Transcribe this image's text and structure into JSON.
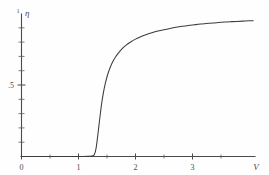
{
  "chart_data": {
    "type": "line",
    "title": "",
    "subtitle": "",
    "xlabel": "V",
    "ylabel": "η",
    "xlim": [
      0,
      3.85
    ],
    "ylim": [
      0,
      1.02
    ],
    "grid": false,
    "legend": null,
    "x_ticks": [
      {
        "value": 0,
        "label": "0",
        "major": true
      },
      {
        "value": 0.5,
        "label": "",
        "major": false
      },
      {
        "value": 1,
        "label": "1",
        "major": true
      },
      {
        "value": 1.5,
        "label": "",
        "major": false
      },
      {
        "value": 2,
        "label": "2",
        "major": true
      },
      {
        "value": 2.5,
        "label": "",
        "major": false
      },
      {
        "value": 3,
        "label": "3",
        "major": true
      },
      {
        "value": 3.5,
        "label": "",
        "major": false
      }
    ],
    "y_ticks": [
      {
        "value": 0.1,
        "label": "",
        "major": false
      },
      {
        "value": 0.2,
        "label": "",
        "major": false
      },
      {
        "value": 0.3,
        "label": "",
        "major": false
      },
      {
        "value": 0.4,
        "label": "",
        "major": false
      },
      {
        "value": 0.5,
        "label": ".5",
        "major": true
      },
      {
        "value": 0.6,
        "label": "",
        "major": false
      },
      {
        "value": 0.7,
        "label": "",
        "major": false
      },
      {
        "value": 0.8,
        "label": "",
        "major": false
      },
      {
        "value": 0.9,
        "label": "",
        "major": false
      },
      {
        "value": 1.0,
        "label": "1",
        "major": true
      }
    ],
    "series": [
      {
        "name": "η(V)",
        "color": "#3c3c3c",
        "points": [
          [
            0.0,
            0.0
          ],
          [
            0.2,
            0.0
          ],
          [
            0.4,
            0.0
          ],
          [
            0.6,
            0.0
          ],
          [
            0.8,
            0.0
          ],
          [
            1.0,
            0.0
          ],
          [
            1.1,
            0.001
          ],
          [
            1.16,
            0.004
          ],
          [
            1.2,
            0.012
          ],
          [
            1.23,
            0.06
          ],
          [
            1.26,
            0.16
          ],
          [
            1.29,
            0.27
          ],
          [
            1.32,
            0.375
          ],
          [
            1.35,
            0.455
          ],
          [
            1.38,
            0.52
          ],
          [
            1.42,
            0.585
          ],
          [
            1.46,
            0.635
          ],
          [
            1.5,
            0.675
          ],
          [
            1.55,
            0.712
          ],
          [
            1.6,
            0.742
          ],
          [
            1.66,
            0.772
          ],
          [
            1.72,
            0.796
          ],
          [
            1.8,
            0.82
          ],
          [
            1.88,
            0.84
          ],
          [
            1.96,
            0.856
          ],
          [
            2.05,
            0.872
          ],
          [
            2.15,
            0.886
          ],
          [
            2.25,
            0.898
          ],
          [
            2.35,
            0.908
          ],
          [
            2.45,
            0.917
          ],
          [
            2.55,
            0.925
          ],
          [
            2.65,
            0.932
          ],
          [
            2.75,
            0.938
          ],
          [
            2.85,
            0.943
          ],
          [
            2.95,
            0.948
          ],
          [
            3.05,
            0.952
          ],
          [
            3.15,
            0.956
          ],
          [
            3.25,
            0.959
          ],
          [
            3.35,
            0.962
          ],
          [
            3.45,
            0.965
          ],
          [
            3.55,
            0.967
          ],
          [
            3.65,
            0.969
          ],
          [
            3.75,
            0.971
          ],
          [
            3.82,
            0.972
          ]
        ]
      }
    ],
    "annotations": [
      {
        "name": "threshold",
        "text": "",
        "x": 1.2,
        "y": 0.0
      }
    ],
    "colors": {
      "background": "#fefefe",
      "axis": "#4a4a4a",
      "curve": "#3c3c3c",
      "text": "#4a4a4a"
    },
    "y_axis_top_marker": "1"
  }
}
